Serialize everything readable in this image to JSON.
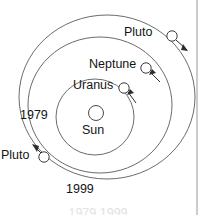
{
  "figure": {
    "type": "orbital-diagram",
    "center_body": {
      "name": "Sun",
      "label": "Sun"
    },
    "orbits": [
      {
        "name": "uranus-orbit",
        "body": "Uranus"
      },
      {
        "name": "neptune-orbit",
        "body": "Neptune"
      },
      {
        "name": "pluto-orbit",
        "body": "Pluto"
      }
    ],
    "labels": {
      "pluto_outer": "Pluto",
      "neptune": "Neptune",
      "uranus": "Uranus",
      "sun": "Sun",
      "pluto_lower": "Pluto",
      "year_1979": "1979",
      "year_1999": "1999"
    },
    "markers": [
      {
        "name": "pluto-marker-outer",
        "body": "Pluto",
        "x": 172,
        "y": 36
      },
      {
        "name": "neptune-marker",
        "body": "Neptune",
        "x": 146,
        "y": 68
      },
      {
        "name": "uranus-marker",
        "body": "Uranus",
        "x": 124,
        "y": 88
      },
      {
        "name": "pluto-marker-lower",
        "body": "Pluto",
        "x": 44,
        "y": 157
      },
      {
        "name": "sun-marker",
        "body": "Sun",
        "x": 96,
        "y": 113
      }
    ],
    "colors": {
      "orbit_stroke": "#5a5a5a",
      "marker_stroke": "#3c3c3c",
      "arrow": "#2e2e2e",
      "text": "#141414",
      "background": "#ffffff",
      "edge_rule": "#b6b6b6"
    },
    "clipped_caption": "1979    1999"
  }
}
